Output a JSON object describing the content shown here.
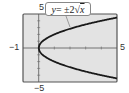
{
  "chart_data": {
    "type": "line",
    "title": "",
    "equation_label": "y = ±2√x",
    "equation_parts": {
      "lhs": "y",
      "eq": " = ±2",
      "radicand": "x"
    },
    "series": [
      {
        "name": "y = 2√x",
        "x": [
          0,
          0.25,
          0.5,
          1,
          2,
          3,
          4,
          5
        ],
        "y": [
          0,
          1,
          1.41,
          2,
          2.83,
          3.46,
          4,
          4.47
        ]
      },
      {
        "name": "y = -2√x",
        "x": [
          0,
          0.25,
          0.5,
          1,
          2,
          3,
          4,
          5
        ],
        "y": [
          0,
          -1,
          -1.41,
          -2,
          -2.83,
          -3.46,
          -4,
          -4.47
        ]
      }
    ],
    "xlim": [
      -1,
      5
    ],
    "ylim": [
      -5,
      5
    ],
    "tick_labels": {
      "xmin": "−1",
      "xmax": "5",
      "ymax": "5",
      "ymin": "−5"
    },
    "xlabel": "",
    "ylabel": "",
    "grid": false,
    "background_color": "#e6e6e6",
    "curve_color": "#1a1a1a"
  }
}
